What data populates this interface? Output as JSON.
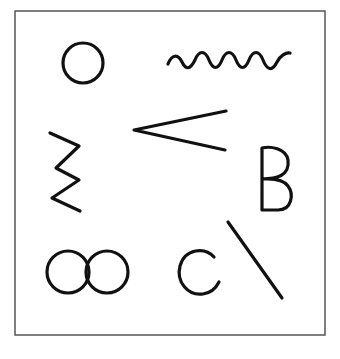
{
  "figure": {
    "frame": {
      "stroke": "#555555"
    },
    "ink": "#111111",
    "shapes": [
      {
        "name": "circle",
        "label": "circle"
      },
      {
        "name": "wavy-line",
        "label": "wavy line"
      },
      {
        "name": "zigzag",
        "label": "zigzag"
      },
      {
        "name": "angle",
        "label": "acute angle / less-than"
      },
      {
        "name": "letter-b",
        "label": "B"
      },
      {
        "name": "infinity",
        "label": "infinity / double circle"
      },
      {
        "name": "letter-c",
        "label": "C"
      },
      {
        "name": "diagonal-line",
        "label": "diagonal line"
      }
    ]
  }
}
